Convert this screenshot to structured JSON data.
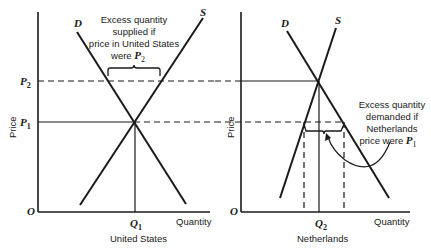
{
  "panels": [
    {
      "id": "united-states",
      "title": "United States",
      "y_axis_label": "Price",
      "x_axis_label": "Quantity",
      "origin_label": "O",
      "demand_label": "D",
      "supply_label": "S",
      "price_labels": [
        {
          "main": "P",
          "sub": "2"
        },
        {
          "main": "P",
          "sub": "1"
        }
      ],
      "quantity_label": {
        "main": "Q",
        "sub": "1"
      },
      "annotation": {
        "lines": [
          "Excess quantity",
          "supplied if",
          "price in United States",
          "were "
        ],
        "trailing": {
          "main": "P",
          "sub": "2"
        }
      }
    },
    {
      "id": "netherlands",
      "title": "Netherlands",
      "y_axis_label": "Price",
      "x_axis_label": "Quantity",
      "origin_label": "O",
      "demand_label": "D",
      "supply_label": "S",
      "quantity_label": {
        "main": "Q",
        "sub": "2"
      },
      "annotation": {
        "lines": [
          "Excess quantity",
          "demanded if",
          "Netherlands",
          "price were "
        ],
        "trailing": {
          "main": "P",
          "sub": "1"
        }
      }
    }
  ]
}
